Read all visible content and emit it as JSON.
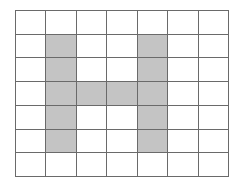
{
  "grid": {
    "rows": 7,
    "cols": 7,
    "line_color": "#6a6a6a",
    "fill_color": "#c4c4c4",
    "empty_color": "#ffffff",
    "filled_cells": [
      [
        1,
        1
      ],
      [
        2,
        1
      ],
      [
        3,
        1
      ],
      [
        4,
        1
      ],
      [
        5,
        1
      ],
      [
        1,
        4
      ],
      [
        2,
        4
      ],
      [
        3,
        4
      ],
      [
        4,
        4
      ],
      [
        5,
        4
      ],
      [
        3,
        2
      ],
      [
        3,
        3
      ]
    ],
    "shape": "H"
  }
}
